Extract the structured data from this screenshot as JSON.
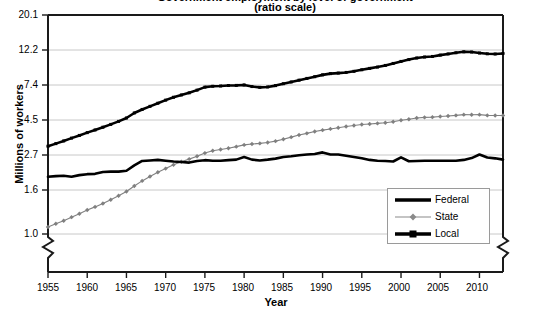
{
  "chart_data": {
    "type": "line",
    "title": "Government employment by level of government",
    "subtitle": "(ratio scale)",
    "xlabel": "Year",
    "ylabel": "Millions of workers",
    "grid": true,
    "yscale": "log",
    "ylim": [
      1.0,
      20.1
    ],
    "xlim": [
      1955,
      2013
    ],
    "ytick_labels": [
      "20.1",
      "12.2",
      "7.4",
      "4.5",
      "2.7",
      "1.6",
      "1.0"
    ],
    "ytick_values": [
      20.1,
      12.2,
      7.4,
      4.5,
      2.7,
      1.6,
      1.0
    ],
    "xtick_labels": [
      "1955",
      "1960",
      "1965",
      "1970",
      "1975",
      "1980",
      "1985",
      "1990",
      "1995",
      "2000",
      "2005",
      "2010"
    ],
    "xtick_values": [
      1955,
      1960,
      1965,
      1970,
      1975,
      1980,
      1985,
      1990,
      1995,
      2000,
      2005,
      2010
    ],
    "axis_break": "zigzag below 1.0 on left and right axes",
    "legend": {
      "position": "lower-right inside plot",
      "entries": [
        {
          "name": "Federal",
          "color": "#000000",
          "width": 2.6,
          "marker": "none"
        },
        {
          "name": "State",
          "color": "#808080",
          "width": 1.0,
          "marker": "diamond"
        },
        {
          "name": "Local",
          "color": "#000000",
          "width": 2.6,
          "marker": "square"
        }
      ]
    },
    "x": [
      1955,
      1956,
      1957,
      1958,
      1959,
      1960,
      1961,
      1962,
      1963,
      1964,
      1965,
      1966,
      1967,
      1968,
      1969,
      1970,
      1971,
      1972,
      1973,
      1974,
      1975,
      1976,
      1977,
      1978,
      1979,
      1980,
      1981,
      1982,
      1983,
      1984,
      1985,
      1986,
      1987,
      1988,
      1989,
      1990,
      1991,
      1992,
      1993,
      1994,
      1995,
      1996,
      1997,
      1998,
      1999,
      2000,
      2001,
      2002,
      2003,
      2004,
      2005,
      2006,
      2007,
      2008,
      2009,
      2010,
      2011,
      2012,
      2013
    ],
    "series": [
      {
        "name": "Federal",
        "color": "#000000",
        "values": [
          2.19,
          2.21,
          2.22,
          2.19,
          2.24,
          2.27,
          2.28,
          2.34,
          2.35,
          2.35,
          2.38,
          2.56,
          2.72,
          2.74,
          2.76,
          2.73,
          2.7,
          2.68,
          2.66,
          2.72,
          2.75,
          2.73,
          2.73,
          2.75,
          2.77,
          2.87,
          2.77,
          2.74,
          2.77,
          2.81,
          2.87,
          2.9,
          2.94,
          2.97,
          2.99,
          3.06,
          2.97,
          2.97,
          2.92,
          2.87,
          2.82,
          2.76,
          2.73,
          2.72,
          2.7,
          2.86,
          2.71,
          2.72,
          2.73,
          2.73,
          2.73,
          2.73,
          2.73,
          2.76,
          2.83,
          2.97,
          2.85,
          2.82,
          2.77
        ]
      },
      {
        "name": "State",
        "color": "#808080",
        "values": [
          1.1,
          1.15,
          1.2,
          1.26,
          1.32,
          1.39,
          1.45,
          1.52,
          1.6,
          1.69,
          1.79,
          1.93,
          2.07,
          2.2,
          2.33,
          2.45,
          2.58,
          2.69,
          2.79,
          2.9,
          3.03,
          3.13,
          3.18,
          3.24,
          3.31,
          3.39,
          3.43,
          3.46,
          3.5,
          3.57,
          3.66,
          3.77,
          3.88,
          3.97,
          4.07,
          4.15,
          4.22,
          4.29,
          4.36,
          4.42,
          4.48,
          4.51,
          4.55,
          4.59,
          4.66,
          4.75,
          4.82,
          4.9,
          4.94,
          4.96,
          5.0,
          5.04,
          5.08,
          5.13,
          5.12,
          5.13,
          5.08,
          5.07,
          5.07
        ]
      },
      {
        "name": "Local",
        "color": "#000000",
        "values": [
          3.33,
          3.45,
          3.58,
          3.72,
          3.86,
          4.01,
          4.16,
          4.32,
          4.49,
          4.68,
          4.9,
          5.25,
          5.51,
          5.75,
          6.0,
          6.26,
          6.51,
          6.72,
          6.92,
          7.18,
          7.48,
          7.57,
          7.6,
          7.65,
          7.66,
          7.71,
          7.54,
          7.46,
          7.5,
          7.64,
          7.84,
          8.03,
          8.23,
          8.43,
          8.63,
          8.85,
          9.0,
          9.07,
          9.15,
          9.29,
          9.49,
          9.67,
          9.85,
          10.07,
          10.35,
          10.64,
          10.91,
          11.15,
          11.3,
          11.39,
          11.6,
          11.79,
          11.98,
          12.14,
          12.1,
          11.94,
          11.81,
          11.78,
          11.87
        ]
      }
    ]
  },
  "axis_labels": {
    "y_title": "Millions of workers",
    "x_title": "Year"
  }
}
